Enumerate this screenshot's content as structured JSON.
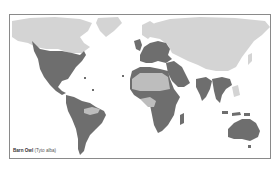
{
  "map": {
    "title": "Barn Owl (Tyto alba) range map",
    "projection": "world",
    "colors": {
      "background": "#ffffff",
      "land_outside_range": "#d4d4d4",
      "range_present": "#6e6e6e",
      "range_absent_within": "#bdbdbd",
      "frame_border": "#8a8a8a"
    },
    "regions": [
      {
        "name": "North America (USA, Mexico)",
        "status": "present"
      },
      {
        "name": "Central America",
        "status": "present"
      },
      {
        "name": "South America",
        "status": "present"
      },
      {
        "name": "Amazon basin",
        "status": "absent"
      },
      {
        "name": "Europe",
        "status": "present"
      },
      {
        "name": "British Isles",
        "status": "present"
      },
      {
        "name": "North Africa coast",
        "status": "present"
      },
      {
        "name": "Sahara",
        "status": "absent"
      },
      {
        "name": "Sub-Saharan Africa",
        "status": "present"
      },
      {
        "name": "Central African rainforest",
        "status": "absent"
      },
      {
        "name": "Madagascar",
        "status": "present"
      },
      {
        "name": "Middle East / Arabia",
        "status": "present"
      },
      {
        "name": "Indian subcontinent",
        "status": "present"
      },
      {
        "name": "Southeast Asia",
        "status": "present"
      },
      {
        "name": "Australia",
        "status": "present"
      },
      {
        "name": "Canada, Greenland, Russia, China",
        "status": "absent"
      }
    ]
  },
  "caption": {
    "common_name": "Barn Owl",
    "scientific_name": "(Tyto alba)"
  }
}
